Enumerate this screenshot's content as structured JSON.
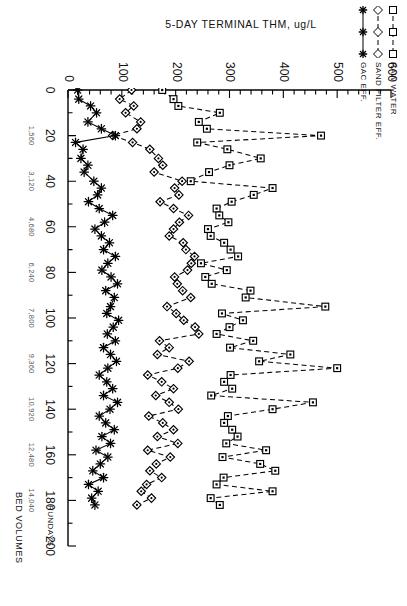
{
  "chart_data": {
    "type": "line",
    "title": "",
    "xlabel": "RUNDAYS",
    "xlabel2": "BED VOLUMES",
    "ylabel": "5-DAY TERMINAL THM, ug/L",
    "ylim": [
      0,
      600
    ],
    "xlim": [
      0,
      200
    ],
    "yticks": [
      0,
      100,
      200,
      300,
      400,
      500,
      600
    ],
    "ytick_labels": [
      "0",
      "100",
      "200",
      "300",
      "400",
      "500",
      "600"
    ],
    "xticks": [
      0,
      20,
      40,
      60,
      80,
      100,
      120,
      140,
      160,
      180,
      200
    ],
    "xtick_labels": [
      "0",
      "20",
      "40",
      "60",
      "80",
      "100",
      "120",
      "140",
      "160",
      "180",
      "200"
    ],
    "minor_xticks_every": 10,
    "minor_yticks_every": 20,
    "bed_volume_ticks": [
      20,
      40,
      60,
      80,
      100,
      120,
      140,
      160,
      180
    ],
    "bed_volume_labels": [
      "1,560",
      "3,120",
      "4,680",
      "6,240",
      "7,800",
      "9,360",
      "10,920",
      "12,480",
      "14,040"
    ],
    "grid": false,
    "legend_position": "upper-left",
    "series": [
      {
        "name": "RAW WATER",
        "marker": "square",
        "line_style": "dashed",
        "color": "#000000",
        "points": [
          [
            0,
            175
          ],
          [
            4,
            196
          ],
          [
            7,
            205
          ],
          [
            10,
            282
          ],
          [
            14,
            243
          ],
          [
            17,
            258
          ],
          [
            20,
            470
          ],
          [
            23,
            240
          ],
          [
            26,
            296
          ],
          [
            30,
            358
          ],
          [
            33,
            300
          ],
          [
            36,
            262
          ],
          [
            40,
            228
          ],
          [
            43,
            380
          ],
          [
            46,
            345
          ],
          [
            49,
            304
          ],
          [
            52,
            276
          ],
          [
            55,
            281
          ],
          [
            58,
            298
          ],
          [
            61,
            260
          ],
          [
            64,
            265
          ],
          [
            67,
            290
          ],
          [
            70,
            302
          ],
          [
            73,
            316
          ],
          [
            76,
            247
          ],
          [
            79,
            295
          ],
          [
            82,
            255
          ],
          [
            85,
            267
          ],
          [
            88,
            339
          ],
          [
            91,
            330
          ],
          [
            95,
            478
          ],
          [
            98,
            286
          ],
          [
            101,
            325
          ],
          [
            104,
            300
          ],
          [
            107,
            276
          ],
          [
            110,
            344
          ],
          [
            113,
            301
          ],
          [
            116,
            413
          ],
          [
            119,
            355
          ],
          [
            122,
            500
          ],
          [
            125,
            302
          ],
          [
            128,
            290
          ],
          [
            131,
            305
          ],
          [
            134,
            266
          ],
          [
            137,
            455
          ],
          [
            140,
            380
          ],
          [
            143,
            297
          ],
          [
            146,
            290
          ],
          [
            149,
            305
          ],
          [
            152,
            315
          ],
          [
            155,
            294
          ],
          [
            158,
            368
          ],
          [
            161,
            287
          ],
          [
            164,
            357
          ],
          [
            167,
            385
          ],
          [
            170,
            289
          ],
          [
            173,
            276
          ],
          [
            176,
            380
          ],
          [
            179,
            265
          ],
          [
            182,
            282
          ]
        ]
      },
      {
        "name": "SAND FILTER EFF.",
        "marker": "diamond",
        "line_style": "dashed",
        "color": "#000000",
        "points": [
          [
            0,
            118
          ],
          [
            4,
            96
          ],
          [
            7,
            122
          ],
          [
            10,
            107
          ],
          [
            14,
            135
          ],
          [
            17,
            128
          ],
          [
            20,
            83
          ],
          [
            23,
            120
          ],
          [
            26,
            152
          ],
          [
            30,
            168
          ],
          [
            33,
            176
          ],
          [
            36,
            160
          ],
          [
            40,
            212
          ],
          [
            43,
            198
          ],
          [
            46,
            206
          ],
          [
            49,
            171
          ],
          [
            52,
            196
          ],
          [
            55,
            224
          ],
          [
            58,
            207
          ],
          [
            61,
            196
          ],
          [
            64,
            188
          ],
          [
            67,
            214
          ],
          [
            70,
            219
          ],
          [
            73,
            235
          ],
          [
            76,
            229
          ],
          [
            79,
            222
          ],
          [
            82,
            198
          ],
          [
            85,
            203
          ],
          [
            88,
            213
          ],
          [
            91,
            228
          ],
          [
            95,
            184
          ],
          [
            98,
            201
          ],
          [
            101,
            215
          ],
          [
            104,
            236
          ],
          [
            107,
            243
          ],
          [
            110,
            170
          ],
          [
            113,
            188
          ],
          [
            116,
            166
          ],
          [
            119,
            225
          ],
          [
            122,
            204
          ],
          [
            125,
            148
          ],
          [
            128,
            174
          ],
          [
            131,
            196
          ],
          [
            134,
            163
          ],
          [
            137,
            188
          ],
          [
            140,
            205
          ],
          [
            143,
            150
          ],
          [
            146,
            176
          ],
          [
            149,
            196
          ],
          [
            152,
            166
          ],
          [
            155,
            204
          ],
          [
            158,
            148
          ],
          [
            161,
            190
          ],
          [
            164,
            164
          ],
          [
            167,
            152
          ],
          [
            170,
            174
          ],
          [
            173,
            146
          ],
          [
            176,
            136
          ],
          [
            179,
            155
          ],
          [
            182,
            128
          ]
        ]
      },
      {
        "name": "GAC EFF.",
        "marker": "star",
        "line_style": "solid",
        "color": "#000000",
        "points": [
          [
            0,
            18
          ],
          [
            4,
            20
          ],
          [
            7,
            42
          ],
          [
            10,
            53
          ],
          [
            14,
            37
          ],
          [
            17,
            62
          ],
          [
            20,
            88
          ],
          [
            23,
            14
          ],
          [
            26,
            28
          ],
          [
            30,
            24
          ],
          [
            33,
            37
          ],
          [
            36,
            30
          ],
          [
            40,
            48
          ],
          [
            43,
            62
          ],
          [
            46,
            55
          ],
          [
            49,
            38
          ],
          [
            52,
            58
          ],
          [
            55,
            83
          ],
          [
            58,
            68
          ],
          [
            61,
            50
          ],
          [
            64,
            62
          ],
          [
            67,
            77
          ],
          [
            70,
            66
          ],
          [
            73,
            88
          ],
          [
            76,
            74
          ],
          [
            79,
            63
          ],
          [
            82,
            80
          ],
          [
            85,
            92
          ],
          [
            88,
            70
          ],
          [
            91,
            86
          ],
          [
            95,
            79
          ],
          [
            98,
            72
          ],
          [
            101,
            94
          ],
          [
            104,
            84
          ],
          [
            107,
            73
          ],
          [
            110,
            88
          ],
          [
            113,
            66
          ],
          [
            116,
            79
          ],
          [
            119,
            90
          ],
          [
            122,
            74
          ],
          [
            125,
            58
          ],
          [
            128,
            72
          ],
          [
            131,
            83
          ],
          [
            134,
            66
          ],
          [
            137,
            92
          ],
          [
            140,
            78
          ],
          [
            143,
            58
          ],
          [
            146,
            70
          ],
          [
            149,
            86
          ],
          [
            152,
            63
          ],
          [
            155,
            79
          ],
          [
            158,
            52
          ],
          [
            161,
            74
          ],
          [
            164,
            60
          ],
          [
            167,
            46
          ],
          [
            170,
            66
          ],
          [
            173,
            38
          ],
          [
            176,
            56
          ],
          [
            179,
            44
          ],
          [
            182,
            50
          ]
        ]
      }
    ]
  },
  "legend": {
    "items": [
      {
        "label": "RAW WATER",
        "marker": "square",
        "line_style": "dashed"
      },
      {
        "label": "SAND FILTER EFF.",
        "marker": "diamond",
        "line_style": "dashed"
      },
      {
        "label": "GAC EFF.",
        "marker": "star",
        "line_style": "solid"
      }
    ]
  },
  "axes": {
    "y_title": "5-DAY TERMINAL THM, ug/L",
    "x_title": "RUNDAYS",
    "x_title2": "BED VOLUMES"
  }
}
